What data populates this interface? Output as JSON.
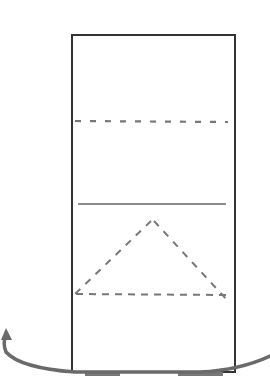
{
  "diagram": {
    "colors": {
      "background": "#ffffff",
      "outline": "#333333",
      "dashed": "#777777",
      "solid_inner": "#666666",
      "arrow": "#6a6a6a"
    },
    "rectangle": {
      "x": 72,
      "y": 35,
      "width": 163,
      "height": 337
    },
    "dashed_line_top": {
      "x1": 75,
      "y1": 121,
      "x2": 228,
      "y2": 122
    },
    "solid_line": {
      "x1": 78,
      "y1": 204,
      "x2": 226,
      "y2": 204
    },
    "triangle": {
      "apex": [
        151,
        221
      ],
      "left": [
        75,
        294
      ],
      "right": [
        228,
        301
      ],
      "base_y": 294
    },
    "arrow": {
      "direction": "counter-clockwise rotation, pointing up-left",
      "start": [
        270,
        355
      ],
      "end": [
        8,
        328
      ]
    },
    "base_shadows": [
      {
        "x": 85,
        "y": 372,
        "width": 35
      },
      {
        "x": 178,
        "y": 372,
        "width": 45
      }
    ]
  }
}
